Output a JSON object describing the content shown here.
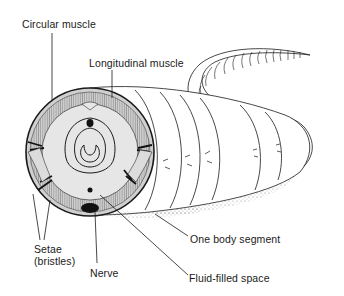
{
  "diagram": {
    "labels": {
      "circular_muscle": "Circular muscle",
      "longitudinal_muscle": "Longitudinal muscle",
      "setae_line1": "Setae",
      "setae_line2": "(bristles)",
      "nerve": "Nerve",
      "one_body_segment": "One body segment",
      "fluid_filled_space": "Fluid-filled space"
    },
    "colors": {
      "ink": "#1a1a1a",
      "fill_light": "#e6e6e6",
      "fill_mid": "#d0d0d0",
      "background": "#ffffff"
    }
  }
}
